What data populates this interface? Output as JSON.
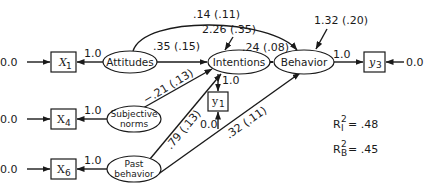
{
  "diagram": {
    "type": "structural-equation-path-diagram",
    "latent_nodes": {
      "attitudes": "Attitudes",
      "intentions": "Intentions",
      "behavior": "Behavior",
      "subjective_norms_line1": "Subjective",
      "subjective_norms_line2": "norms",
      "past_behavior_line1": "Past",
      "past_behavior_line2": "behavior"
    },
    "observed_nodes": {
      "x1": "X",
      "x1_sub": "1",
      "x4": "X",
      "x4_sub": "4",
      "x6": "X",
      "x6_sub": "6",
      "y1": "y",
      "y1_sub": "1",
      "y3": "y",
      "y3_sub": "3"
    },
    "errors": {
      "x1": "0.0",
      "x4": "0.0",
      "x6": "0.0",
      "y1": "0.0",
      "y3": "0.0"
    },
    "loadings": {
      "attitudes_x1": "1.0",
      "subjective_norms_x4": "1.0",
      "past_behavior_x6": "1.0",
      "intentions_y1": "1.0",
      "behavior_y3": "1.0"
    },
    "paths": {
      "attitudes_intentions": ".35 (.15)",
      "attitudes_behavior": ".14 (.11)",
      "subjective_norms_intentions": "−.21 (.13)",
      "past_behavior_intentions": ".79 (.13)",
      "past_behavior_behavior": ".32 (.11)",
      "intentions_behavior": ".24 (.08)"
    },
    "disturbances": {
      "intentions": "2.26 (.35)",
      "behavior": "1.32 (.20)"
    },
    "r_squared": {
      "intentions_label": "R",
      "intentions_sup": "2",
      "intentions_sub": "I",
      "intentions_value": "= .48",
      "behavior_label": "R",
      "behavior_sup": "2",
      "behavior_sub": "B",
      "behavior_value": "= .45"
    }
  }
}
